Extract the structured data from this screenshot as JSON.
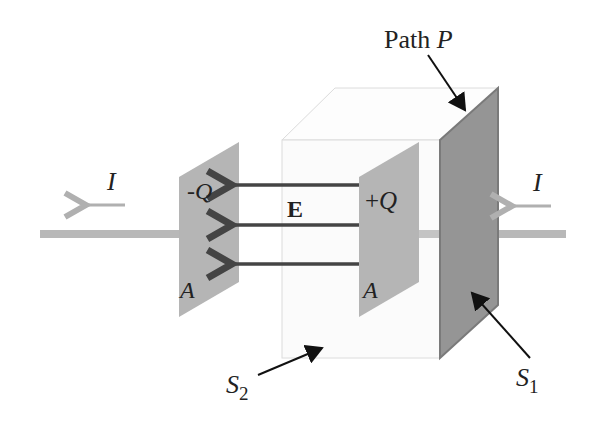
{
  "figure": {
    "type": "capacitor-gauss-surface-diagram",
    "labels": {
      "path": "Path",
      "path_var": "P",
      "current_left": "I",
      "current_right": "I",
      "neg_charge": "-Q",
      "pos_charge": "+Q",
      "field": "E",
      "area_left": "A",
      "area_right": "A",
      "surface2": "S",
      "surface2_sub": "2",
      "surface1": "S",
      "surface1_sub": "1"
    },
    "colors": {
      "wire": "#b8b8b8",
      "current_arrow": "#b0b0b0",
      "plate": "#b5b5b5",
      "surface1_plate": "#959595",
      "surface1_edge": "#7a7a7a",
      "box_edge": "#dcdcdc",
      "box_face": "#fbfbfb",
      "field_arrow": "#444444",
      "text": "#222222"
    },
    "field_lines": 3
  }
}
